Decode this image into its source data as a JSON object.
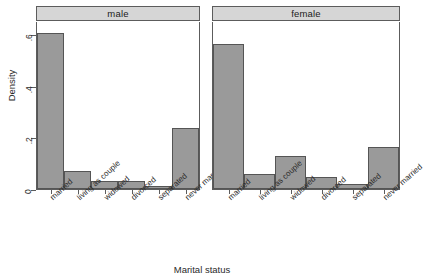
{
  "chart_data": {
    "type": "bar",
    "title": "",
    "xlabel": "Marital status",
    "ylabel": "Density",
    "ylim": [
      0,
      0.65
    ],
    "yticks": [
      0,
      0.2,
      0.4,
      0.6
    ],
    "ytick_labels": [
      "0",
      ".2",
      ".4",
      ".6"
    ],
    "grid": false,
    "legend": null,
    "categories": [
      "married",
      "living as couple",
      "widowed",
      "divorced",
      "separated",
      "never married"
    ],
    "panels": [
      {
        "label": "male",
        "values": [
          0.605,
          0.068,
          0.032,
          0.03,
          0.012,
          0.237
        ]
      },
      {
        "label": "female",
        "values": [
          0.563,
          0.058,
          0.128,
          0.048,
          0.02,
          0.163
        ]
      }
    ],
    "series": [
      {
        "name": "male",
        "values": [
          0.605,
          0.068,
          0.032,
          0.03,
          0.012,
          0.237
        ]
      },
      {
        "name": "female",
        "values": [
          0.563,
          0.058,
          0.128,
          0.048,
          0.02,
          0.163
        ]
      }
    ],
    "colors": {
      "bar_fill": "#9a9a9a",
      "bar_border": "#555555",
      "strip_fill": "#d6d6d6",
      "axis": "#5c5c5c",
      "background": "#ffffff"
    }
  }
}
